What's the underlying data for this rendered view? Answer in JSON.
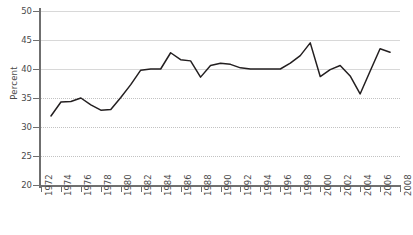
{
  "chart_data": {
    "type": "line",
    "title": "",
    "xlabel": "",
    "ylabel": "Percent",
    "ylim": [
      20,
      50
    ],
    "xlim": [
      1972,
      2008
    ],
    "ytick_labels": [
      "50",
      "45",
      "40",
      "35",
      "30",
      "25",
      "20"
    ],
    "ytick_values": [
      50,
      45,
      40,
      35,
      30,
      25,
      20
    ],
    "xtick_labels": [
      "1972",
      "1974",
      "1976",
      "1978",
      "1980",
      "1982",
      "1984",
      "1986",
      "1988",
      "1990",
      "1992",
      "1994",
      "1996",
      "1998",
      "2000",
      "2002",
      "2004",
      "2006",
      "2008"
    ],
    "xtick_values": [
      1972,
      1974,
      1976,
      1978,
      1980,
      1982,
      1984,
      1986,
      1988,
      1990,
      1992,
      1994,
      1996,
      1998,
      2000,
      2002,
      2004,
      2006,
      2008
    ],
    "grid": true,
    "legend": false,
    "series_color": "#231f20",
    "x": [
      1973,
      1974,
      1975,
      1976,
      1977,
      1978,
      1979,
      1980,
      1981,
      1982,
      1983,
      1984,
      1985,
      1986,
      1987,
      1988,
      1989,
      1990,
      1991,
      1992,
      1993,
      1994,
      1995,
      1996,
      1997,
      1998,
      1999,
      2000,
      2001,
      2002,
      2003,
      2004,
      2005,
      2006,
      2007
    ],
    "values": [
      31.9,
      34.3,
      34.4,
      35.0,
      33.8,
      32.9,
      33.0,
      35.1,
      37.3,
      39.8,
      40.0,
      40.0,
      42.8,
      41.6,
      41.4,
      38.6,
      40.6,
      41.0,
      40.8,
      40.2,
      40.0,
      40.0,
      40.0,
      40.0,
      41.0,
      42.3,
      44.5,
      38.7,
      39.9,
      40.6,
      38.8,
      35.7,
      39.6,
      43.5,
      42.9
    ]
  },
  "caption": {
    "text": ""
  }
}
